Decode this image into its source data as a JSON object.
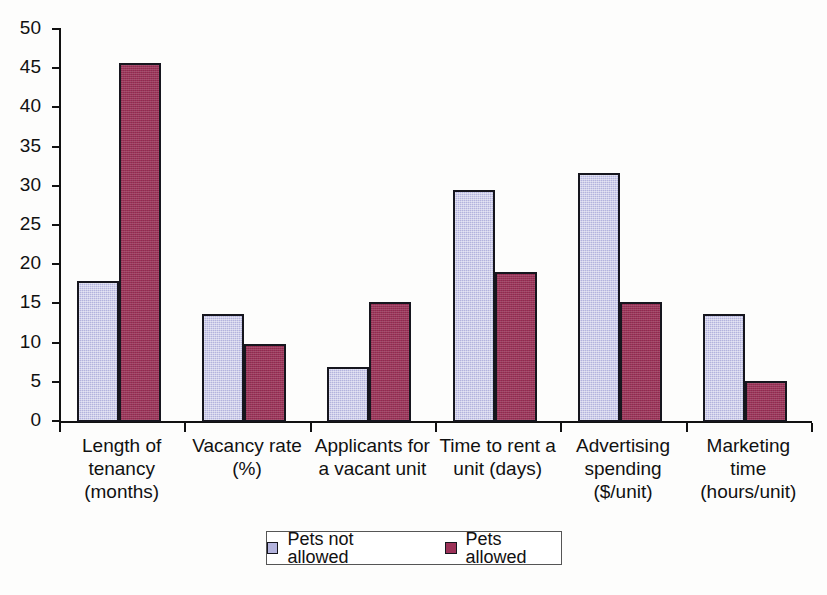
{
  "chart_data": {
    "type": "bar",
    "title": "",
    "xlabel": "",
    "ylabel": "",
    "ylim": [
      0,
      50
    ],
    "ytick_step": 5,
    "grid": false,
    "legend_position": "bottom-center",
    "categories": [
      "Length of\ntenancy\n(months)",
      "Vacancy rate\n(%)",
      "Applicants for\na vacant unit",
      "Time to rent a\nunit (days)",
      "Advertising\nspending\n($/unit)",
      "Marketing\ntime\n(hours/unit)"
    ],
    "ytick_labels": [
      "0",
      "5",
      "10",
      "15",
      "20",
      "25",
      "30",
      "35",
      "40",
      "45",
      "50"
    ],
    "series": [
      {
        "name": "Pets not allowed",
        "color": "#b3b3dd",
        "values": [
          18.0,
          13.8,
          7.0,
          29.6,
          31.8,
          13.8
        ]
      },
      {
        "name": "Pets allowed",
        "color": "#9c3258",
        "values": [
          45.8,
          9.9,
          15.3,
          19.1,
          15.3,
          5.2
        ]
      }
    ]
  },
  "legend": {
    "items": [
      {
        "label": "Pets not allowed",
        "color": "#b3b3dd"
      },
      {
        "label": "Pets allowed",
        "color": "#9c3258"
      }
    ]
  }
}
